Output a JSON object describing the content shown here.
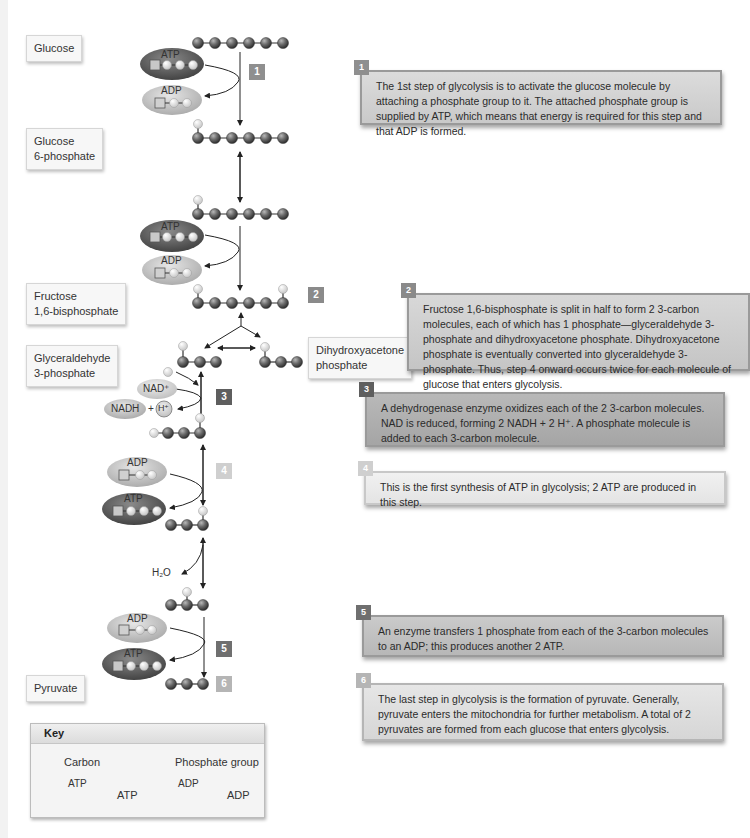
{
  "labels": {
    "glucose": "Glucose",
    "glucose_6_phosphate_l1": "Glucose",
    "glucose_6_phosphate_l2": "6-phosphate",
    "fructose_l1": "Fructose",
    "fructose_l2": "1,6-bisphosphate",
    "g3p_l1": "Glyceraldehyde",
    "g3p_l2": "3-phosphate",
    "dhap_l1": "Dihydroxyacetone",
    "dhap_l2": "phosphate",
    "pyruvate": "Pyruvate"
  },
  "molecules": {
    "atp": "ATP",
    "adp": "ADP",
    "nad_plus": "NAD⁺",
    "nadh": "NADH",
    "plus": "+",
    "h_plus": "H⁺",
    "water": "H₂O"
  },
  "steps": [
    {
      "number": "1",
      "color": "#8f8f8f",
      "text": "The 1st step of glycolysis is to activate the glucose molecule by attaching a phosphate group to it. The attached phosphate group is supplied by ATP, which means that energy is required for this step and that ADP is formed."
    },
    {
      "number": "2",
      "color": "#8a8a8a",
      "text": "Fructose 1,6-bisphosphate is split in half to form 2 3-carbon molecules, each of which has 1 phosphate—glyceraldehyde 3-phosphate and dihydroxyacetone phosphate. Dihydroxyacetone phosphate is eventually converted into glyceraldehyde 3-phosphate. Thus, step 4 onward occurs twice for each molecule of glucose that enters glycolysis."
    },
    {
      "number": "3",
      "color": "#5e5e5e",
      "text": "A dehydrogenase enzyme oxidizes each of the 2 3-carbon molecules. NAD is reduced, forming 2 NADH + 2 H⁺. A phosphate molecule is added to each 3-carbon molecule."
    },
    {
      "number": "4",
      "color": "#cfcfcf",
      "text": "This is the first synthesis of ATP in glycolysis; 2 ATP are produced in this step."
    },
    {
      "number": "5",
      "color": "#6f6f6f",
      "text": "An enzyme transfers 1 phosphate from each of the 3-carbon molecules to an ADP; this produces another 2 ATP."
    },
    {
      "number": "6",
      "color": "#b5b5b5",
      "text": "The last step in glycolysis is the formation of pyruvate. Generally, pyruvate enters the mitochondria for further metabolism. A total of 2 pyruvates are formed from each glucose that enters glycolysis."
    }
  ],
  "key": {
    "title": "Key",
    "carbon": "Carbon",
    "phosphate": "Phosphate group",
    "atp": "ATP",
    "adp": "ADP"
  }
}
